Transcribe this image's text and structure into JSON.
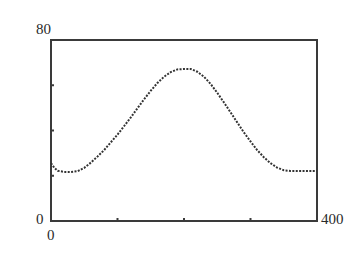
{
  "chart_data": {
    "type": "scatter",
    "title": "",
    "xlabel": "",
    "ylabel": "",
    "xlim": [
      0,
      400
    ],
    "ylim": [
      0,
      80
    ],
    "grid": false,
    "legend": null,
    "axis_labels": {
      "y_max": "80",
      "y_min": "0",
      "x_min": "0",
      "x_max": "400"
    },
    "x_ticks": [
      100,
      200,
      300
    ],
    "y_ticks": [
      20,
      40,
      60
    ],
    "series": [
      {
        "name": "curve",
        "style": "dotted",
        "color": "#333333",
        "points": [
          [
            0,
            25.6
          ],
          [
            5,
            23.5
          ],
          [
            10,
            22.2
          ],
          [
            20,
            21.7
          ],
          [
            30,
            21.7
          ],
          [
            40,
            22.0
          ],
          [
            50,
            23.5
          ],
          [
            60,
            25.8
          ],
          [
            70,
            28.5
          ],
          [
            80,
            31.4
          ],
          [
            90,
            34.8
          ],
          [
            100,
            38.2
          ],
          [
            110,
            42.0
          ],
          [
            120,
            45.8
          ],
          [
            130,
            49.8
          ],
          [
            140,
            53.8
          ],
          [
            150,
            57.6
          ],
          [
            160,
            61.0
          ],
          [
            170,
            63.8
          ],
          [
            180,
            65.8
          ],
          [
            190,
            67.0
          ],
          [
            200,
            67.2
          ],
          [
            210,
            67.2
          ],
          [
            220,
            66.0
          ],
          [
            230,
            63.8
          ],
          [
            240,
            60.6
          ],
          [
            250,
            56.6
          ],
          [
            260,
            52.4
          ],
          [
            270,
            48.0
          ],
          [
            280,
            43.6
          ],
          [
            290,
            39.2
          ],
          [
            300,
            35.2
          ],
          [
            310,
            31.4
          ],
          [
            320,
            28.2
          ],
          [
            330,
            25.6
          ],
          [
            340,
            23.6
          ],
          [
            350,
            22.4
          ],
          [
            360,
            22.1
          ],
          [
            380,
            22.1
          ],
          [
            400,
            22.1
          ]
        ]
      }
    ]
  }
}
